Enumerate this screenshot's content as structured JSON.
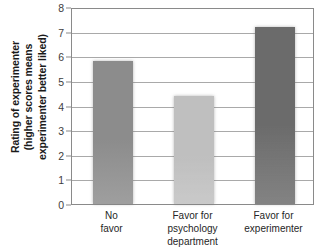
{
  "chart_data": {
    "type": "bar",
    "title": "",
    "xlabel": "",
    "ylabel": "Rating of experimenter (higher scores means experimenter better liked)",
    "ylabel_lines": [
      "Rating of experimenter",
      "(higher scores means",
      "experimenter better liked)"
    ],
    "categories": [
      "No favor",
      "Favor for psychology department",
      "Favor for experimenter"
    ],
    "category_lines": [
      [
        "No",
        "favor"
      ],
      [
        "Favor for",
        "psychology",
        "department"
      ],
      [
        "Favor for",
        "experimenter"
      ]
    ],
    "values": [
      5.8,
      4.4,
      7.2
    ],
    "bar_colors": [
      "#8c8c8c",
      "#bfbfbf",
      "#6b6b6b"
    ],
    "ylim": [
      0,
      8
    ],
    "ytick_labels": [
      "0",
      "1",
      "2",
      "3",
      "4",
      "5",
      "6",
      "7",
      "8"
    ],
    "ytick_values": [
      0,
      1,
      2,
      3,
      4,
      5,
      6,
      7,
      8
    ],
    "grid": true,
    "legend": "none",
    "axis_color": "#8a8a8a",
    "gridline_color": "#a9a9a9"
  }
}
